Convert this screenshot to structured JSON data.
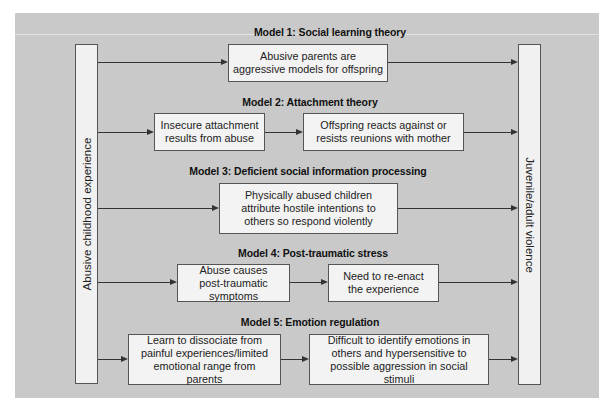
{
  "diagram": {
    "source_label": "Abusive childhood experience",
    "target_label": "Juvenile/adult violence",
    "models": [
      {
        "title": "Model 1: Social learning theory",
        "steps": [
          "Abusive parents are aggressive models for offspring"
        ]
      },
      {
        "title": "Model 2: Attachment theory",
        "steps": [
          "Insecure attachment results from abuse",
          "Offspring reacts against or resists reunions with mother"
        ]
      },
      {
        "title": "Model 3: Deficient social information processing",
        "steps": [
          "Physically abused children attribute hostile intentions to others so respond violently"
        ]
      },
      {
        "title": "Model 4: Post-traumatic stress",
        "steps": [
          "Abuse causes post-traumatic symptoms",
          "Need to re-enact the experience"
        ]
      },
      {
        "title": "Model 5: Emotion regulation",
        "steps": [
          "Learn to dissociate from painful experiences/limited emotional range from parents",
          "Difficult to identify emotions in others and hypersensitive to possible aggression in social stimuli"
        ]
      }
    ]
  },
  "colors": {
    "panel_background": "#c9c9c9",
    "box_fill": "#f3f3f3",
    "border": "#555555",
    "arrow": "#333333"
  }
}
